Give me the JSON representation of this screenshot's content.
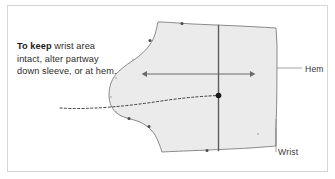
{
  "figure": {
    "name": "sleeve-pattern-alteration-diagram",
    "caption": {
      "lead": "To keep",
      "body": " wrist area intact, alter partway down sleeve, or at hem."
    },
    "labels": {
      "hem": "Hem",
      "wrist": "Wrist"
    },
    "colors": {
      "pattern_fill": "#ebebeb",
      "pattern_stroke": "#6f6f6f",
      "arrow": "#6a6a6a",
      "dashed_guide": "#2a2a2a",
      "frame_rule": "#d8d6d2",
      "text": "#2e2c2a",
      "leader": "#8d8b88"
    },
    "annotations": {
      "grainline_arrow": "double-headed-horizontal-arrow",
      "alteration_line": "vertical-alteration-line",
      "guide_curve": "dashed-curved-leader",
      "guide_point": "alteration-point-dot"
    }
  }
}
